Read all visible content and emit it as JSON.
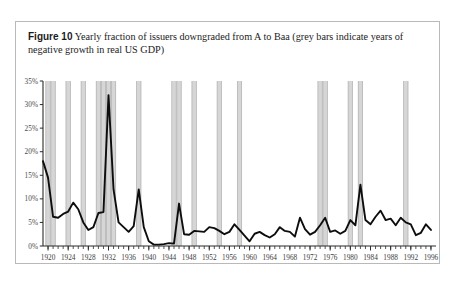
{
  "caption": {
    "figure_label": "Figure 10",
    "text": "Yearly fraction of issuers downgraded from A to Baa (grey bars indicate years of negative growth in real US GDP)"
  },
  "chart_data": {
    "type": "line",
    "title": "Yearly fraction of issuers downgraded from A to Baa",
    "xlabel": "",
    "ylabel": "",
    "xlim": [
      1919,
      1997
    ],
    "ylim": [
      0,
      35
    ],
    "grid": false,
    "legend_position": "none",
    "y_ticks": [
      "0%",
      "5%",
      "10%",
      "15%",
      "20%",
      "25%",
      "30%",
      "35%"
    ],
    "y_tick_values": [
      0,
      5,
      10,
      15,
      20,
      25,
      30,
      35
    ],
    "x_ticks": [
      "1920",
      "1924",
      "1928",
      "1932",
      "1936",
      "1940",
      "1944",
      "1948",
      "1952",
      "1956",
      "1960",
      "1964",
      "1968",
      "1972",
      "1976",
      "1980",
      "1984",
      "1988",
      "1992",
      "1996"
    ],
    "x_tick_values": [
      1920,
      1924,
      1928,
      1932,
      1936,
      1940,
      1944,
      1948,
      1952,
      1956,
      1960,
      1964,
      1968,
      1972,
      1976,
      1980,
      1984,
      1988,
      1992,
      1996
    ],
    "x_minor_step": 1,
    "series": [
      {
        "name": "Yearly fraction of issuers downgraded from A to Baa",
        "color": "#0d0d0d",
        "x": [
          1919,
          1920,
          1921,
          1922,
          1923,
          1924,
          1925,
          1926,
          1927,
          1928,
          1929,
          1930,
          1931,
          1932,
          1933,
          1934,
          1935,
          1936,
          1937,
          1938,
          1939,
          1940,
          1941,
          1942,
          1943,
          1944,
          1945,
          1946,
          1947,
          1948,
          1949,
          1950,
          1951,
          1952,
          1953,
          1954,
          1955,
          1956,
          1957,
          1958,
          1959,
          1960,
          1961,
          1962,
          1963,
          1964,
          1965,
          1966,
          1967,
          1968,
          1969,
          1970,
          1971,
          1972,
          1973,
          1974,
          1975,
          1976,
          1977,
          1978,
          1979,
          1980,
          1981,
          1982,
          1983,
          1984,
          1985,
          1986,
          1987,
          1988,
          1989,
          1990,
          1991,
          1992,
          1993,
          1994,
          1995,
          1996
        ],
        "y": [
          18.0,
          14.5,
          6.2,
          6.0,
          6.8,
          7.3,
          9.2,
          7.8,
          5.0,
          3.4,
          4.0,
          7.0,
          7.2,
          32.0,
          12.0,
          5.0,
          4.0,
          3.0,
          4.2,
          12.0,
          4.0,
          1.0,
          0.3,
          0.3,
          0.4,
          0.6,
          0.5,
          9.0,
          2.5,
          2.4,
          3.2,
          3.1,
          3.0,
          4.0,
          3.8,
          3.2,
          2.5,
          3.0,
          4.6,
          3.4,
          2.2,
          1.0,
          2.6,
          3.0,
          2.3,
          1.8,
          2.5,
          4.0,
          3.2,
          3.0,
          2.0,
          6.0,
          3.6,
          2.4,
          3.0,
          4.4,
          6.0,
          3.0,
          3.3,
          2.6,
          3.2,
          5.5,
          4.4,
          13.0,
          5.5,
          4.6,
          6.2,
          7.5,
          5.5,
          5.8,
          4.4,
          6.0,
          5.0,
          4.6,
          2.3,
          2.8,
          4.6,
          3.4
        ]
      }
    ],
    "recession_bands": {
      "label": "years of negative growth in real US GDP",
      "color": "#cfcfcf",
      "years": [
        1920,
        1921,
        1924,
        1927,
        1930,
        1931,
        1932,
        1933,
        1938,
        1945,
        1946,
        1949,
        1954,
        1958,
        1974,
        1975,
        1980,
        1982,
        1991
      ]
    }
  }
}
